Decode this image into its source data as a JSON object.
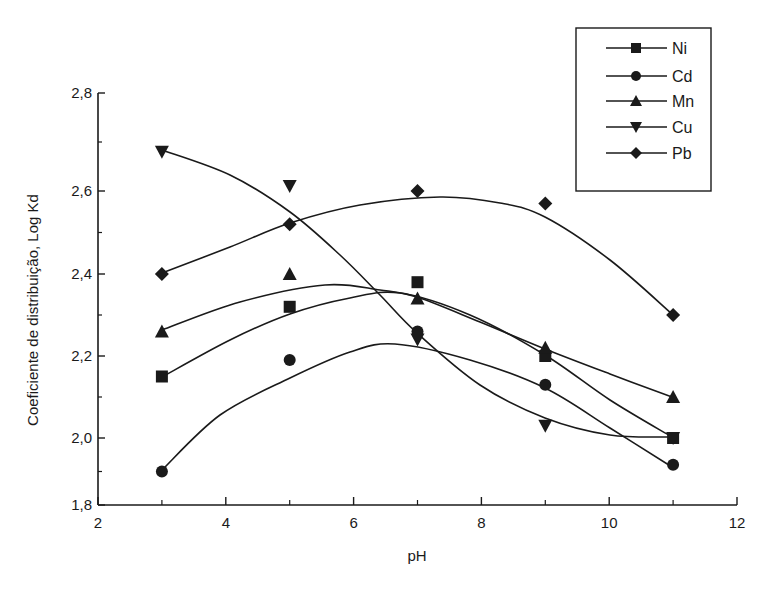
{
  "chart_data": {
    "type": "line",
    "title": "",
    "xlabel": "pH",
    "ylabel": "Coeficiente de distribuição, Log Kd",
    "xlim": [
      2,
      12
    ],
    "ylim": [
      1.8,
      2.8
    ],
    "xticks": [
      2,
      4,
      6,
      8,
      10,
      12
    ],
    "xtick_labels": [
      "2",
      "4",
      "6",
      "8",
      "10",
      "12"
    ],
    "yticks": [
      1.8,
      2.0,
      2.2,
      2.4,
      2.6,
      2.8
    ],
    "ytick_labels": [
      "1,8",
      "2,0",
      "2,2",
      "2,4",
      "2,6",
      "2,8"
    ],
    "grid": false,
    "legend_position": "upper right (outside plot top)",
    "x": [
      3,
      5,
      7,
      9,
      11
    ],
    "series": [
      {
        "name": "Ni",
        "marker": "square",
        "values": [
          2.15,
          2.32,
          2.38,
          2.2,
          2.0
        ]
      },
      {
        "name": "Cd",
        "marker": "circle",
        "values": [
          1.9,
          2.19,
          2.26,
          2.13,
          1.92
        ]
      },
      {
        "name": "Mn",
        "marker": "triangle-up",
        "values": [
          2.26,
          2.4,
          2.34,
          2.22,
          2.1
        ]
      },
      {
        "name": "Cu",
        "marker": "triangle-down",
        "values": [
          2.68,
          2.61,
          2.24,
          2.03,
          2.0
        ]
      },
      {
        "name": "Pb",
        "marker": "diamond",
        "values": [
          2.4,
          2.52,
          2.6,
          2.57,
          2.3
        ]
      }
    ],
    "fit_curves": "smooth polynomial fit lines drawn through each series"
  },
  "render": {
    "color": "#1a1a1a",
    "background": "#ffffff",
    "curves_px": {
      "Ni": [
        [
          162,
          377
        ],
        [
          230,
          340
        ],
        [
          290,
          314
        ],
        [
          350,
          298
        ],
        [
          400,
          293
        ],
        [
          470,
          315
        ],
        [
          545,
          355
        ],
        [
          610,
          400
        ],
        [
          672,
          437
        ]
      ],
      "Cd": [
        [
          162,
          470
        ],
        [
          220,
          415
        ],
        [
          290,
          378
        ],
        [
          350,
          352
        ],
        [
          395,
          344
        ],
        [
          470,
          360
        ],
        [
          545,
          388
        ],
        [
          610,
          428
        ],
        [
          672,
          467
        ]
      ],
      "Mn": [
        [
          162,
          330
        ],
        [
          240,
          302
        ],
        [
          325,
          285
        ],
        [
          380,
          290
        ],
        [
          417,
          297
        ],
        [
          480,
          322
        ],
        [
          545,
          349
        ],
        [
          610,
          374
        ],
        [
          672,
          397
        ]
      ],
      "Cu": [
        [
          162,
          150
        ],
        [
          230,
          175
        ],
        [
          290,
          212
        ],
        [
          340,
          255
        ],
        [
          380,
          295
        ],
        [
          417,
          333
        ],
        [
          480,
          385
        ],
        [
          545,
          418
        ],
        [
          610,
          435
        ],
        [
          672,
          437
        ]
      ],
      "Pb": [
        [
          162,
          273
        ],
        [
          230,
          247
        ],
        [
          290,
          223
        ],
        [
          360,
          205
        ],
        [
          440,
          197
        ],
        [
          500,
          203
        ],
        [
          545,
          217
        ],
        [
          610,
          260
        ],
        [
          672,
          314
        ]
      ]
    }
  }
}
